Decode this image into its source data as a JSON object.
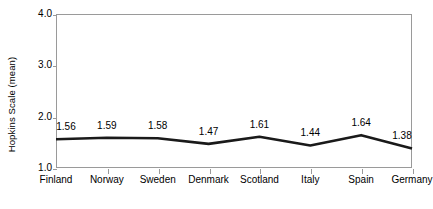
{
  "chart_data": {
    "type": "line",
    "title": "",
    "xlabel": "",
    "ylabel": "Hopkins Scale (mean)",
    "categories": [
      "Finland",
      "Norway",
      "Sweden",
      "Denmark",
      "Scotland",
      "Italy",
      "Spain",
      "Germany"
    ],
    "values": [
      1.56,
      1.59,
      1.58,
      1.47,
      1.61,
      1.44,
      1.64,
      1.38
    ],
    "data_labels": [
      "1.56",
      "1.59",
      "1.58",
      "1.47",
      "1.61",
      "1.44",
      "1.64",
      "1.38"
    ],
    "ylim": [
      1.0,
      4.0
    ],
    "yticks": [
      1.0,
      2.0,
      3.0,
      4.0
    ],
    "ytick_labels": [
      "1.0",
      "2.0",
      "3.0",
      "4.0"
    ],
    "grid": false,
    "legend": null,
    "line_color": "#1a1a1a",
    "frame_color": "#9a9a9a",
    "background_color": "#ffffff"
  }
}
